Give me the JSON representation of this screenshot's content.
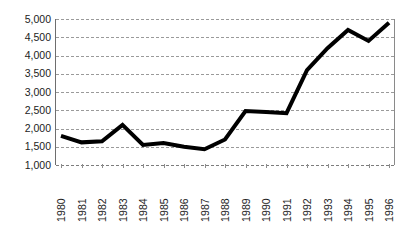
{
  "chart_data": {
    "type": "line",
    "title": "",
    "subtitle": "",
    "xlabel": "",
    "ylabel": "",
    "x": [
      1980,
      1981,
      1982,
      1983,
      1984,
      1985,
      1986,
      1987,
      1988,
      1989,
      1990,
      1991,
      1992,
      1993,
      1994,
      1995,
      1996
    ],
    "categories": [
      "1980",
      "1981",
      "1982",
      "1983",
      "1984",
      "1985",
      "1986",
      "1987",
      "1988",
      "1989",
      "1990",
      "1991",
      "1992",
      "1993",
      "1994",
      "1995",
      "1996"
    ],
    "values": [
      1800,
      1620,
      1650,
      2100,
      1550,
      1600,
      1500,
      1430,
      1700,
      2480,
      2450,
      2420,
      3600,
      4200,
      4700,
      4400,
      4900
    ],
    "series": [
      {
        "name": "",
        "values": [
          1800,
          1620,
          1650,
          2100,
          1550,
          1600,
          1500,
          1430,
          1700,
          2480,
          2450,
          2420,
          3600,
          4200,
          4700,
          4400,
          4900
        ],
        "color": "#000000",
        "line_width": 4
      }
    ],
    "ylim": [
      1000,
      5000
    ],
    "ytick_labels": [
      "5,000",
      "4,500",
      "4,000",
      "3,500",
      "3,000",
      "2,500",
      "2,000",
      "1,500",
      "1,000"
    ],
    "ytick_values": [
      5000,
      4500,
      4000,
      3500,
      3000,
      2500,
      2000,
      1500,
      1000
    ],
    "ytick_step": 500,
    "grid": true,
    "grid_style": "dashed",
    "grid_color": "#9a9a9a",
    "legend": false,
    "legend_position": "none",
    "markers": false,
    "annotations": [],
    "axis_color": "#6e6e6e",
    "background": "#ffffff"
  }
}
